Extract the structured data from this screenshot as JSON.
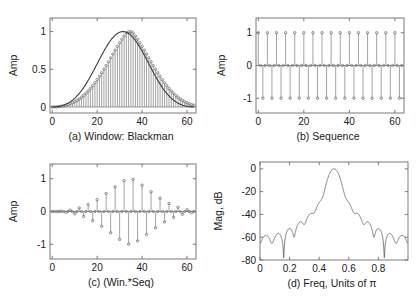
{
  "figure": {
    "title": "",
    "panel_count": 4
  },
  "chart_data": [
    {
      "id": "a",
      "type": "bar",
      "title": "(a)  Window: Blackman",
      "caption": "(a)  Window: Blackman",
      "xlabel": "",
      "ylabel": "Amp",
      "xlim": [
        -1,
        64
      ],
      "ylim": [
        -0.08,
        1.18
      ],
      "xticks": [
        0,
        20,
        40,
        60
      ],
      "xticklabels": [
        "0",
        "20",
        "40",
        "60"
      ],
      "yticks": [
        0,
        0.5,
        1
      ],
      "yticklabels": [
        "0",
        "0.5",
        "1"
      ],
      "grid": false,
      "legend": "none",
      "marker_style": "dot",
      "n": 64,
      "description": "Blackman window of length 64 drawn as stems with dot markers following a smooth bell curve peaking at 1 near n=31",
      "values": [
        0.0,
        0.0006,
        0.0023,
        0.0053,
        0.0095,
        0.0151,
        0.0223,
        0.0312,
        0.0419,
        0.0546,
        0.0696,
        0.0869,
        0.1066,
        0.129,
        0.1541,
        0.1819,
        0.2126,
        0.246,
        0.2822,
        0.3211,
        0.3625,
        0.4063,
        0.4523,
        0.5001,
        0.5495,
        0.6,
        0.6512,
        0.7026,
        0.7536,
        0.8036,
        0.8521,
        0.8984,
        0.9419,
        0.982,
        0.9981,
        0.9981,
        0.982,
        0.9419,
        0.8984,
        0.8521,
        0.8036,
        0.7536,
        0.7026,
        0.6512,
        0.6,
        0.5495,
        0.5001,
        0.4523,
        0.4063,
        0.3625,
        0.3211,
        0.2822,
        0.246,
        0.2126,
        0.1819,
        0.1541,
        0.129,
        0.1066,
        0.0869,
        0.0696,
        0.0546,
        0.0419,
        0.0312,
        0.0223
      ]
    },
    {
      "id": "b",
      "type": "bar",
      "title": "(b)  Sequence",
      "caption": "(b)  Sequence",
      "xlabel": "",
      "ylabel": "Amp",
      "xlim": [
        -1,
        64
      ],
      "ylim": [
        -1.45,
        1.45
      ],
      "xticks": [
        0,
        20,
        40,
        60
      ],
      "xticklabels": [
        "0",
        "20",
        "40",
        "60"
      ],
      "yticks": [
        -1,
        0,
        1
      ],
      "yticklabels": [
        "-1",
        "0",
        "1"
      ],
      "grid": false,
      "legend": "none",
      "marker_style": "dot",
      "n": 64,
      "description": "Cosine sequence cos(pi*n/2) giving the repeating pattern 1, 0, -1, 0 shown as stems",
      "pattern": [
        1,
        0,
        -1,
        0
      ]
    },
    {
      "id": "c",
      "type": "bar",
      "title": "(c)  (Win.*Seq)",
      "caption": "(c)  (Win.*Seq)",
      "xlabel": "",
      "ylabel": "Amp",
      "xlim": [
        -1,
        64
      ],
      "ylim": [
        -1.45,
        1.45
      ],
      "xticks": [
        0,
        20,
        40,
        60
      ],
      "xticklabels": [
        "0",
        "20",
        "40",
        "60"
      ],
      "yticks": [
        -1,
        0,
        1
      ],
      "yticklabels": [
        "-1",
        "0",
        "1"
      ],
      "grid": false,
      "legend": "none",
      "marker_style": "dot",
      "n": 64,
      "description": "Element-wise product of the Blackman window and the cosine sequence; stems alternate sign with Blackman envelope peaking near +/-1"
    },
    {
      "id": "d",
      "type": "line",
      "title": "(d)  Freq, Units of π",
      "caption": "(d)  Freq, Units of π",
      "xlabel": "",
      "ylabel": "Mag, dB",
      "xlim": [
        0,
        1
      ],
      "ylim": [
        -80,
        6
      ],
      "xticks": [
        0,
        0.2,
        0.4,
        0.6,
        0.8
      ],
      "xticklabels": [
        "0",
        "0.2",
        "0.4",
        "0.6",
        "0.8"
      ],
      "yticks": [
        -80,
        -60,
        -40,
        -20,
        0
      ],
      "yticklabels": [
        "-80",
        "-60",
        "-40",
        "-20",
        "0"
      ],
      "grid": false,
      "legend": "none",
      "description": "Magnitude response in dB of the windowed cosine: bandpass main lobe centered at 0.5 pi reaching 0 dB, sidelobes ripple below -58 dB, floor clipped at -80 dB",
      "center_freq": 0.5,
      "peak_db": 0,
      "sidelobe_db": -58,
      "floor_db": -80
    }
  ]
}
